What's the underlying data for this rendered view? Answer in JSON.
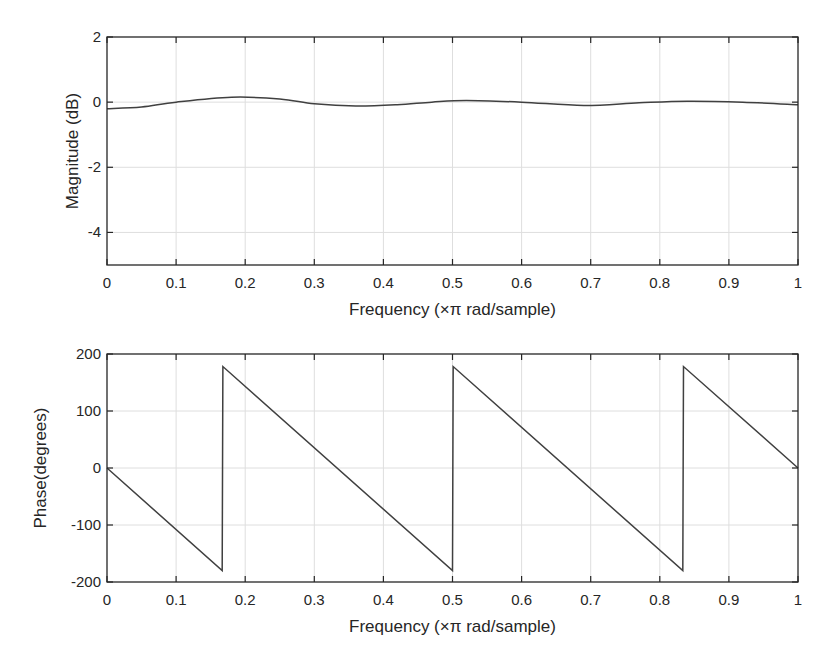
{
  "chart_data": [
    {
      "type": "line",
      "title": "",
      "xlabel": "Frequency (×π rad/sample)",
      "ylabel": "Magnitude (dB)",
      "xlim": [
        0,
        1
      ],
      "ylim": [
        -5,
        2
      ],
      "xticks": [
        0,
        0.1,
        0.2,
        0.3,
        0.4,
        0.5,
        0.6,
        0.7,
        0.8,
        0.9,
        1
      ],
      "xtick_labels": [
        "0",
        "0.1",
        "0.2",
        "0.3",
        "0.4",
        "0.5",
        "0.6",
        "0.7",
        "0.8",
        "0.9",
        "1"
      ],
      "yticks": [
        2,
        0,
        -2,
        -4
      ],
      "ytick_labels": [
        "2",
        "0",
        "-2",
        "-4"
      ],
      "grid": true,
      "series": [
        {
          "name": "Magnitude",
          "x": [
            0,
            0.05,
            0.1,
            0.18,
            0.25,
            0.3,
            0.36,
            0.42,
            0.47,
            0.52,
            0.6,
            0.69,
            0.77,
            0.84,
            0.92,
            1.0
          ],
          "values": [
            -0.2,
            -0.15,
            0.0,
            0.15,
            0.1,
            -0.05,
            -0.12,
            -0.08,
            0.0,
            0.05,
            0.0,
            -0.1,
            -0.02,
            0.03,
            0.0,
            -0.08
          ]
        }
      ]
    },
    {
      "type": "line",
      "title": "",
      "xlabel": "Frequency (×π rad/sample)",
      "ylabel": "Phase(degrees)",
      "xlim": [
        0,
        1
      ],
      "ylim": [
        -200,
        200
      ],
      "xticks": [
        0,
        0.1,
        0.2,
        0.3,
        0.4,
        0.5,
        0.6,
        0.7,
        0.8,
        0.9,
        1
      ],
      "xtick_labels": [
        "0",
        "0.1",
        "0.2",
        "0.3",
        "0.4",
        "0.5",
        "0.6",
        "0.7",
        "0.8",
        "0.9",
        "1"
      ],
      "yticks": [
        200,
        100,
        0,
        -100,
        -200
      ],
      "ytick_labels": [
        "200",
        "100",
        "0",
        "-100",
        "-200"
      ],
      "grid": true,
      "series": [
        {
          "name": "Phase",
          "x": [
            0,
            0.1667,
            0.1677,
            0.5,
            0.501,
            0.8333,
            0.8343,
            1.0
          ],
          "values": [
            0,
            -180,
            178,
            -180,
            178,
            -180,
            178,
            0
          ]
        }
      ]
    }
  ],
  "plots": {
    "top": {
      "ylabel": "Magnitude (dB)",
      "xlabel": "Frequency (×π rad/sample)"
    },
    "bottom": {
      "ylabel": "Phase(degrees)",
      "xlabel": "Frequency (×π rad/sample)"
    }
  },
  "colors": {
    "line": "#404040",
    "axes": "#262626",
    "grid": "#dedede"
  }
}
